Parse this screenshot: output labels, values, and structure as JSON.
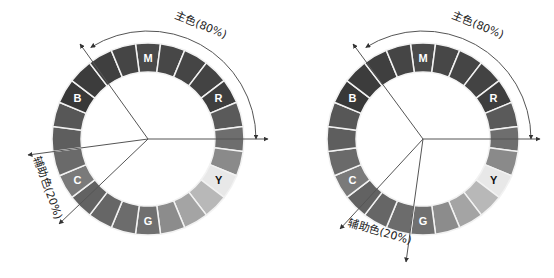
{
  "diagrams": [
    {
      "name": "scheme-left",
      "primary_label": "主色(80%)",
      "secondary_label": "辅助色(20%)"
    },
    {
      "name": "scheme-right",
      "primary_label": "主色(80%)",
      "secondary_label": "辅助色(20%)"
    }
  ],
  "wheel": {
    "segment_count": 24,
    "labels": [
      {
        "text": "M",
        "segment": 0
      },
      {
        "text": "R",
        "segment": 4
      },
      {
        "text": "Y",
        "segment": 8
      },
      {
        "text": "G",
        "segment": 12
      },
      {
        "text": "C",
        "segment": 16
      },
      {
        "text": "B",
        "segment": 20
      }
    ],
    "segment_grays": [
      "#4a4a4a",
      "#474747",
      "#454545",
      "#434343",
      "#3e3e3e",
      "#5a5a5a",
      "#6e6e6e",
      "#8a8a8a",
      "#e8e8e8",
      "#b8b8b8",
      "#a4a4a4",
      "#8c8c8c",
      "#707070",
      "#6c6c6c",
      "#666666",
      "#626262",
      "#7a7a7a",
      "#6a6a6a",
      "#5e5e5e",
      "#575757",
      "#383838",
      "#3c3c3c",
      "#3f3f3f",
      "#454545"
    ],
    "label_color_dark": "#ffffff",
    "label_color_light": "#111111",
    "divider_color": "#f2f2f2",
    "line_color": "#555555"
  }
}
